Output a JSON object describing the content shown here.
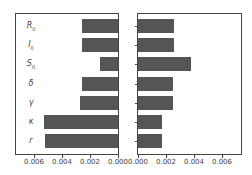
{
  "chart_data": [
    {
      "type": "bar",
      "orientation": "horizontal",
      "direction": "inverted-x",
      "categories": [
        "R0",
        "I0",
        "S0",
        "δ",
        "γ",
        "κ",
        "r"
      ],
      "values": [
        0.0026,
        0.0026,
        0.0013,
        0.0026,
        0.0027,
        0.0053,
        0.0052
      ],
      "title": "",
      "xlabel": "",
      "ylabel": "",
      "xlim": [
        0.007,
        0.0
      ],
      "xticks": [
        "0.006",
        "0.004",
        "0.002",
        "0.000"
      ],
      "grid": false,
      "color": "#555555"
    },
    {
      "type": "bar",
      "orientation": "horizontal",
      "categories": [
        "R0",
        "I0",
        "S0",
        "δ",
        "γ",
        "κ",
        "r"
      ],
      "values": [
        0.0026,
        0.0026,
        0.0038,
        0.0025,
        0.0025,
        0.0017,
        0.0017
      ],
      "title": "",
      "xlabel": "",
      "ylabel": "",
      "xlim": [
        0.0,
        0.0072
      ],
      "xticks": [
        "0.000",
        "0.002",
        "0.004",
        "0.006"
      ],
      "grid": false,
      "color": "#555555"
    }
  ],
  "labels": [
    {
      "main": "R",
      "sub": "0"
    },
    {
      "main": "I",
      "sub": "0"
    },
    {
      "main": "S",
      "sub": "0"
    },
    {
      "main": "δ",
      "sub": ""
    },
    {
      "main": "γ",
      "sub": ""
    },
    {
      "main": "κ",
      "sub": ""
    },
    {
      "main": "r",
      "sub": ""
    }
  ],
  "left_ticks": [
    "0.006",
    "0.004",
    "0.002",
    "0.000"
  ],
  "right_ticks": [
    "0.000",
    "0.002",
    "0.004",
    "0.006"
  ]
}
